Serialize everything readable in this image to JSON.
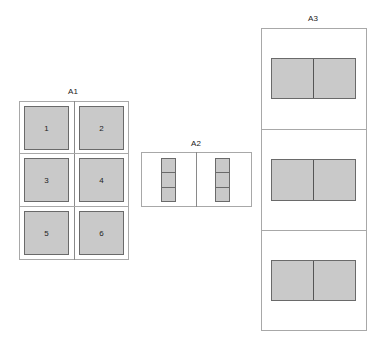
{
  "diagram": {
    "colors": {
      "page_fill": "#c9c9c9",
      "page_border": "#6a6a6a",
      "sheet_border": "#a8a8a8"
    },
    "layouts": [
      {
        "label": "A1",
        "description": "3x2 grid of pages on a portrait sheet",
        "pages": [
          "1",
          "2",
          "3",
          "4",
          "5",
          "6"
        ]
      },
      {
        "label": "A2",
        "description": "Landscape sheet split into two halves, each with a vertical strip of 3 segments"
      },
      {
        "label": "A3",
        "description": "Tall sheet split into three sections, each with a two-pane panel"
      }
    ]
  }
}
